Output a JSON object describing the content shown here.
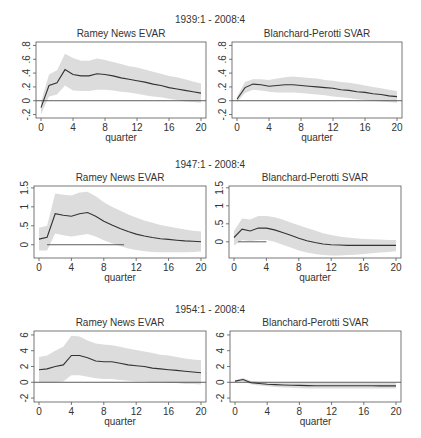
{
  "figure": {
    "rows": [
      {
        "sample_label": "1939:1 - 2008:4",
        "sample_label_x": 210,
        "sample_label_y": 23
      },
      {
        "sample_label": "1947:1 - 2008:4",
        "sample_label_x": 210,
        "sample_label_y": 168
      },
      {
        "sample_label": "1954:1 - 2008:4",
        "sample_label_x": 210,
        "sample_label_y": 313
      }
    ],
    "colors": {
      "band": "#dcdcdc",
      "line": "#333333",
      "axis": "#555555",
      "zero_line": "#333333",
      "text": "#333333"
    }
  },
  "chart_data": [
    {
      "type": "line",
      "panel": "row1-left",
      "sample": "1939:1 - 2008:4",
      "title": "Ramey News EVAR",
      "xlabel": "quarter",
      "ylabel": "",
      "xlim": [
        0,
        20
      ],
      "ylim": [
        -0.25,
        0.85
      ],
      "xticks": [
        0,
        4,
        8,
        12,
        16,
        20
      ],
      "xtick_labels": [
        "0",
        "4",
        "8",
        "12",
        "16",
        "20"
      ],
      "yticks": [
        -0.2,
        0,
        0.2,
        0.4,
        0.6,
        0.8
      ],
      "ytick_labels": [
        "-.2",
        "0",
        ".2",
        ".4",
        ".6",
        ".8"
      ],
      "x": [
        0,
        1,
        2,
        3,
        4,
        5,
        6,
        7,
        8,
        9,
        10,
        11,
        12,
        13,
        14,
        15,
        16,
        17,
        18,
        19,
        20
      ],
      "series": [
        {
          "name": "IRF",
          "values": [
            -0.1,
            0.22,
            0.26,
            0.45,
            0.38,
            0.36,
            0.36,
            0.39,
            0.38,
            0.36,
            0.33,
            0.31,
            0.29,
            0.27,
            0.24,
            0.22,
            0.19,
            0.17,
            0.15,
            0.13,
            0.11
          ]
        },
        {
          "name": "upper band",
          "values": [
            -0.02,
            0.38,
            0.44,
            0.68,
            0.62,
            0.58,
            0.58,
            0.61,
            0.59,
            0.56,
            0.53,
            0.5,
            0.48,
            0.45,
            0.42,
            0.39,
            0.36,
            0.34,
            0.31,
            0.28,
            0.25
          ]
        },
        {
          "name": "lower band",
          "values": [
            -0.2,
            0.06,
            0.09,
            0.22,
            0.15,
            0.14,
            0.14,
            0.16,
            0.16,
            0.15,
            0.13,
            0.12,
            0.1,
            0.08,
            0.06,
            0.05,
            0.03,
            0.01,
            -0.01,
            -0.02,
            -0.03
          ]
        }
      ],
      "zero_line": true,
      "grid": false
    },
    {
      "type": "line",
      "panel": "row1-right",
      "sample": "1939:1 - 2008:4",
      "title": "Blanchard-Perotti SVAR",
      "xlabel": "quarter",
      "ylabel": "",
      "xlim": [
        0,
        20
      ],
      "ylim": [
        -0.25,
        0.85
      ],
      "xticks": [
        0,
        4,
        8,
        12,
        16,
        20
      ],
      "xtick_labels": [
        "0",
        "4",
        "8",
        "12",
        "16",
        "20"
      ],
      "yticks": [
        -0.2,
        0,
        0.2,
        0.4,
        0.6,
        0.8
      ],
      "ytick_labels": [
        "-.2",
        "0",
        ".2",
        ".4",
        ".6",
        ".8"
      ],
      "x": [
        0,
        1,
        2,
        3,
        4,
        5,
        6,
        7,
        8,
        9,
        10,
        11,
        12,
        13,
        14,
        15,
        16,
        17,
        18,
        19,
        20
      ],
      "series": [
        {
          "name": "IRF",
          "values": [
            0.02,
            0.19,
            0.24,
            0.23,
            0.21,
            0.22,
            0.23,
            0.23,
            0.22,
            0.21,
            0.2,
            0.19,
            0.18,
            0.16,
            0.15,
            0.13,
            0.12,
            0.1,
            0.09,
            0.07,
            0.06
          ]
        },
        {
          "name": "upper band",
          "values": [
            0.06,
            0.27,
            0.31,
            0.31,
            0.3,
            0.32,
            0.34,
            0.35,
            0.34,
            0.33,
            0.32,
            0.3,
            0.29,
            0.27,
            0.26,
            0.24,
            0.22,
            0.2,
            0.18,
            0.16,
            0.14
          ]
        },
        {
          "name": "lower band",
          "values": [
            -0.02,
            0.11,
            0.16,
            0.15,
            0.13,
            0.12,
            0.12,
            0.12,
            0.11,
            0.1,
            0.09,
            0.08,
            0.06,
            0.05,
            0.04,
            0.02,
            0.01,
            0.0,
            -0.01,
            -0.02,
            -0.03
          ]
        }
      ],
      "zero_line": true,
      "grid": false
    },
    {
      "type": "line",
      "panel": "row2-left",
      "sample": "1947:1 - 2008:4",
      "title": "Ramey News EVAR",
      "xlabel": "quarter",
      "ylabel": "",
      "xlim": [
        0,
        20
      ],
      "ylim": [
        -0.35,
        1.55
      ],
      "xticks": [
        0,
        4,
        8,
        12,
        16,
        20
      ],
      "xtick_labels": [
        "0",
        "4",
        "8",
        "12",
        "16",
        "20"
      ],
      "yticks": [
        0,
        0.5,
        1,
        1.5
      ],
      "ytick_labels": [
        "0",
        ".5",
        "1",
        "1.5"
      ],
      "x": [
        0,
        1,
        2,
        3,
        4,
        5,
        6,
        7,
        8,
        9,
        10,
        11,
        12,
        13,
        14,
        15,
        16,
        17,
        18,
        19,
        20
      ],
      "series": [
        {
          "name": "IRF",
          "values": [
            0.15,
            0.2,
            0.82,
            0.78,
            0.75,
            0.82,
            0.85,
            0.75,
            0.62,
            0.52,
            0.43,
            0.35,
            0.28,
            0.23,
            0.19,
            0.16,
            0.14,
            0.12,
            0.1,
            0.09,
            0.08
          ]
        },
        {
          "name": "upper band",
          "values": [
            0.45,
            0.5,
            1.35,
            1.32,
            1.3,
            1.38,
            1.4,
            1.28,
            1.12,
            1.0,
            0.9,
            0.8,
            0.72,
            0.64,
            0.58,
            0.52,
            0.48,
            0.44,
            0.4,
            0.37,
            0.35
          ]
        },
        {
          "name": "lower band",
          "values": [
            -0.15,
            -0.15,
            0.3,
            0.25,
            0.22,
            0.25,
            0.28,
            0.22,
            0.12,
            0.04,
            -0.03,
            -0.1,
            -0.14,
            -0.17,
            -0.19,
            -0.2,
            -0.2,
            -0.2,
            -0.2,
            -0.19,
            -0.18
          ]
        }
      ],
      "zero_line": true,
      "zero_line_range": [
        1,
        10.5
      ],
      "grid": false
    },
    {
      "type": "line",
      "panel": "row2-right",
      "sample": "1947:1 - 2008:4",
      "title": "Blanchard-Perotti SVAR",
      "xlabel": "quarter",
      "ylabel": "",
      "xlim": [
        0,
        20
      ],
      "ylim": [
        -0.45,
        1.55
      ],
      "xticks": [
        0,
        4,
        8,
        12,
        16,
        20
      ],
      "xtick_labels": [
        "0",
        "4",
        "8",
        "12",
        "16",
        "20"
      ],
      "yticks": [
        0,
        0.5,
        1,
        1.5
      ],
      "ytick_labels": [
        "0",
        ".5",
        "1",
        "1.5"
      ],
      "x": [
        0,
        1,
        2,
        3,
        4,
        5,
        6,
        7,
        8,
        9,
        10,
        11,
        12,
        13,
        14,
        15,
        16,
        17,
        18,
        19,
        20
      ],
      "series": [
        {
          "name": "IRF",
          "values": [
            0.12,
            0.35,
            0.3,
            0.38,
            0.38,
            0.33,
            0.26,
            0.18,
            0.1,
            0.03,
            -0.02,
            -0.06,
            -0.08,
            -0.09,
            -0.1,
            -0.1,
            -0.1,
            -0.1,
            -0.1,
            -0.1,
            -0.1
          ]
        },
        {
          "name": "upper band",
          "values": [
            0.3,
            0.65,
            0.62,
            0.72,
            0.72,
            0.68,
            0.62,
            0.54,
            0.46,
            0.38,
            0.31,
            0.24,
            0.19,
            0.15,
            0.12,
            0.1,
            0.08,
            0.07,
            0.06,
            0.05,
            0.05
          ]
        },
        {
          "name": "lower band",
          "values": [
            -0.1,
            0.05,
            0.02,
            0.05,
            0.05,
            0.0,
            -0.08,
            -0.16,
            -0.24,
            -0.3,
            -0.34,
            -0.37,
            -0.38,
            -0.38,
            -0.37,
            -0.36,
            -0.34,
            -0.32,
            -0.3,
            -0.28,
            -0.26
          ]
        }
      ],
      "zero_line": true,
      "zero_line_range": [
        0.5,
        4
      ],
      "grid": false
    },
    {
      "type": "line",
      "panel": "row3-left",
      "sample": "1954:1 - 2008:4",
      "title": "Ramey News EVAR",
      "xlabel": "quarter",
      "ylabel": "",
      "xlim": [
        0,
        20
      ],
      "ylim": [
        -2.5,
        6.5
      ],
      "xticks": [
        0,
        4,
        8,
        12,
        16,
        20
      ],
      "xtick_labels": [
        "0",
        "4",
        "8",
        "12",
        "16",
        "20"
      ],
      "yticks": [
        -2,
        0,
        2,
        4,
        6
      ],
      "ytick_labels": [
        "-2",
        "0",
        "2",
        "4",
        "6"
      ],
      "x": [
        0,
        1,
        2,
        3,
        4,
        5,
        6,
        7,
        8,
        9,
        10,
        11,
        12,
        13,
        14,
        15,
        16,
        17,
        18,
        19,
        20
      ],
      "series": [
        {
          "name": "IRF",
          "values": [
            1.6,
            1.7,
            2.0,
            2.2,
            3.4,
            3.4,
            3.1,
            2.7,
            2.6,
            2.6,
            2.4,
            2.2,
            2.1,
            2.0,
            1.8,
            1.7,
            1.6,
            1.5,
            1.4,
            1.3,
            1.2
          ]
        },
        {
          "name": "upper band",
          "values": [
            3.2,
            3.4,
            4.0,
            4.5,
            5.9,
            5.8,
            5.3,
            4.9,
            4.8,
            4.7,
            4.5,
            4.3,
            4.1,
            3.9,
            3.7,
            3.5,
            3.4,
            3.2,
            3.0,
            2.9,
            2.8
          ]
        },
        {
          "name": "lower band",
          "values": [
            0.0,
            0.0,
            0.0,
            0.1,
            0.9,
            0.9,
            0.7,
            0.5,
            0.4,
            0.4,
            0.3,
            0.2,
            0.1,
            0.1,
            0.0,
            0.0,
            -0.1,
            -0.1,
            -0.2,
            -0.2,
            -0.3
          ]
        }
      ],
      "zero_line": true,
      "grid": false
    },
    {
      "type": "line",
      "panel": "row3-right",
      "sample": "1954:1 - 2008:4",
      "title": "Blanchard-Perotti SVAR",
      "xlabel": "quarter",
      "ylabel": "",
      "xlim": [
        0,
        20
      ],
      "ylim": [
        -2.5,
        6.5
      ],
      "xticks": [
        0,
        4,
        8,
        12,
        16,
        20
      ],
      "xtick_labels": [
        "0",
        "4",
        "8",
        "12",
        "16",
        "20"
      ],
      "yticks": [
        -2,
        0,
        2,
        4,
        6
      ],
      "ytick_labels": [
        "-2",
        "0",
        "2",
        "4",
        "6"
      ],
      "x": [
        0,
        1,
        2,
        3,
        4,
        5,
        6,
        7,
        8,
        9,
        10,
        11,
        12,
        13,
        14,
        15,
        16,
        17,
        18,
        19,
        20
      ],
      "series": [
        {
          "name": "IRF",
          "values": [
            0.15,
            0.35,
            -0.05,
            -0.15,
            -0.25,
            -0.3,
            -0.35,
            -0.38,
            -0.4,
            -0.42,
            -0.43,
            -0.44,
            -0.44,
            -0.45,
            -0.45,
            -0.45,
            -0.45,
            -0.45,
            -0.46,
            -0.46,
            -0.46
          ]
        },
        {
          "name": "upper band",
          "values": [
            0.25,
            0.55,
            0.15,
            0.05,
            0.0,
            -0.05,
            -0.08,
            -0.1,
            -0.1,
            -0.1,
            -0.1,
            -0.1,
            -0.1,
            -0.1,
            -0.1,
            -0.1,
            -0.1,
            -0.1,
            -0.1,
            -0.1,
            -0.1
          ]
        },
        {
          "name": "lower band",
          "values": [
            0.05,
            0.15,
            -0.25,
            -0.4,
            -0.5,
            -0.6,
            -0.65,
            -0.7,
            -0.75,
            -0.78,
            -0.8,
            -0.8,
            -0.8,
            -0.8,
            -0.8,
            -0.8,
            -0.8,
            -0.8,
            -0.8,
            -0.8,
            -0.8
          ]
        }
      ],
      "zero_line": true,
      "grid": false
    }
  ],
  "layout": {
    "panels": [
      {
        "x0": 36,
        "x1": 206,
        "y0": 42,
        "y1": 118,
        "title_y": 37
      },
      {
        "x0": 232,
        "x1": 402,
        "y0": 42,
        "y1": 118,
        "title_y": 37
      },
      {
        "x0": 34,
        "x1": 206,
        "y0": 186,
        "y1": 258,
        "title_y": 181
      },
      {
        "x0": 229,
        "x1": 401,
        "y0": 186,
        "y1": 258,
        "title_y": 181
      },
      {
        "x0": 34,
        "x1": 206,
        "y0": 331,
        "y1": 402,
        "title_y": 326
      },
      {
        "x0": 230,
        "x1": 401,
        "y0": 331,
        "y1": 402,
        "title_y": 326
      }
    ]
  }
}
